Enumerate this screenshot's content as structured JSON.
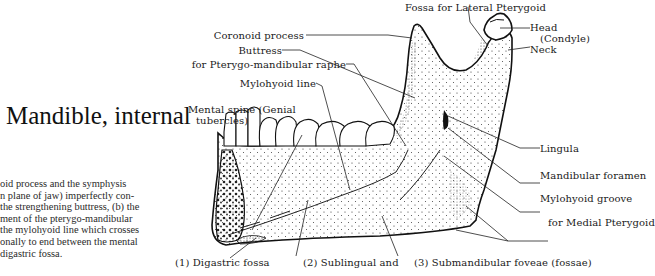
{
  "page": {
    "title": "Mandible, internal",
    "body_lines": [
      "oid process and the symphysis",
      "n plane of jaw) imperfectly con-",
      "the strengthening buttress, (b) the",
      "ment of the pterygo-mandibular",
      " the mylohyoid line which crosses",
      "onally to end between the mental",
      " digastric fossa."
    ]
  },
  "figure": {
    "labels_top": {
      "fossa_lateral_pterygoid": "Fossa for Lateral Pterygoid"
    },
    "labels_left": {
      "coronoid": "Coronoid process",
      "buttress": "Buttress",
      "raphe": "for Pterygo-mandibular raphe",
      "mylohyoid_line": "Mylohyoid line",
      "mental_spine_1": "Mental spine (Genial",
      "mental_spine_2": "tubercles)"
    },
    "labels_right": {
      "head": "Head",
      "condyle": "(Condyle)",
      "neck": "Neck",
      "lingula": "Lingula",
      "mandibular_foramen": "Mandibular foramen",
      "mylohyoid_groove": "Mylohyoid groove",
      "medial_pterygoid": "for Medial Pterygoid"
    },
    "labels_bottom": {
      "digastric": "(1) Digastric fossa",
      "sublingual": "(2) Sublingual and",
      "submandibular": "(3) Submandibular foveae (fossae)"
    }
  }
}
